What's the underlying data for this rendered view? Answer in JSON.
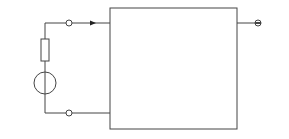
{
  "diagram": {
    "type": "two-port network circuit",
    "port1": {
      "terminal_top": "1",
      "terminal_bottom": "1′",
      "current_label": "I1(s)",
      "voltage_label": "U1(s)",
      "plus": "+",
      "minus": "−"
    },
    "port2": {
      "terminal_top": "2",
      "terminal_bottom": "2′",
      "current_label": "I2(s)",
      "voltage_label": "U2(s)",
      "plus": "+",
      "minus": "−"
    },
    "source": {
      "label": "US(s)",
      "plus": "+",
      "minus": "−"
    },
    "source_resistor": {
      "label": "5 Ω"
    },
    "load_resistor": {
      "label": "10 Ω"
    },
    "colors": {
      "line": "#444444",
      "text": "#222222",
      "background": "#ffffff"
    }
  }
}
